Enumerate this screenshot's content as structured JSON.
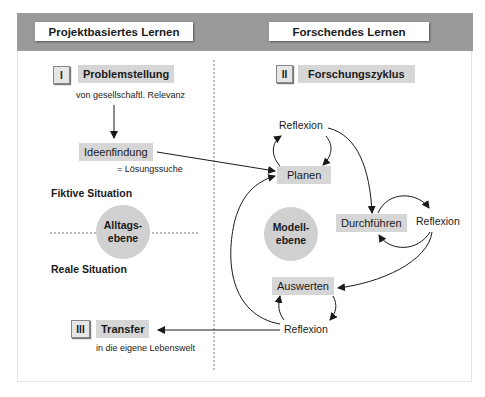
{
  "header": {
    "left_title": "Projektbasiertes Lernen",
    "right_title": "Forschendes Lernen"
  },
  "left": {
    "step1": {
      "number": "I",
      "title": "Problemstellung",
      "subtitle": "von gesellschaftl. Relevanz"
    },
    "ideation": {
      "title": "Ideenfindung",
      "subtitle": "= Lösungssuche"
    },
    "fictive_label": "Fiktive Situation",
    "real_label": "Reale Situation",
    "level_circle": "Alltags-\nebene",
    "step3": {
      "number": "III",
      "title": "Transfer",
      "subtitle": "in die eigene Lebenswelt"
    }
  },
  "right": {
    "step2": {
      "number": "II",
      "title": "Forschungszyklus"
    },
    "cycle": {
      "reflexion_top": "Reflexion",
      "planen": "Planen",
      "durchfuehren": "Durchführen",
      "reflexion_right": "Reflexion",
      "auswerten": "Auswerten",
      "reflexion_bottom": "Reflexion"
    },
    "level_circle": "Modell-\nebene"
  },
  "colors": {
    "header_band": "#9a9a9a",
    "label_fill": "#d6d6d6",
    "circle_fill": "#d0d0d0",
    "line": "#1a1a1a"
  }
}
